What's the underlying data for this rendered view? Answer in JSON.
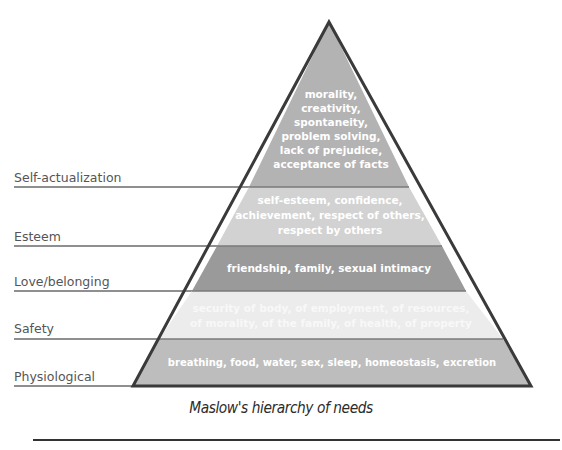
{
  "diagram": {
    "title": "Maslow's hierarchy of needs",
    "levels": [
      {
        "name": "Self-actualization",
        "lines": [
          "morality,",
          "creativity,",
          "spontaneity,",
          "problem solving,",
          "lack of prejudice,",
          "acceptance of facts"
        ],
        "color": "#b3b3b3"
      },
      {
        "name": "Esteem",
        "lines": [
          "self-esteem, confidence,",
          "achievement, respect of others,",
          "respect by others"
        ],
        "color": "#d2d2d2"
      },
      {
        "name": "Love/belonging",
        "lines": [
          "friendship, family, sexual intimacy"
        ],
        "color": "#9a9a9a"
      },
      {
        "name": "Safety",
        "lines": [
          "security of body, of employment, of resources,",
          "of morality, of the family, of health, of property"
        ],
        "color": "#ececec"
      },
      {
        "name": "Physiological",
        "lines": [
          "breathing, food, water, sex, sleep, homeostasis, excretion"
        ],
        "color": "#bdbdbd"
      }
    ],
    "outline_color": "#3a3a3a",
    "label_color": "#555555"
  }
}
